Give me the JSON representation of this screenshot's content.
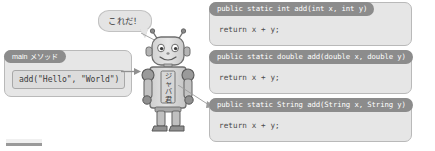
{
  "diagram": {
    "speech_bubble": {
      "text": "これだ！",
      "icon": "speech-bubble-icon"
    },
    "main_method": {
      "header_label": "main メソッド",
      "call_statement": "add(\"Hello\", \"World\")"
    },
    "character": {
      "name": "java-kun-robot",
      "chest_label": "ジャバ君",
      "label_chars": [
        "ジ",
        "ャ",
        "バ",
        "君"
      ]
    },
    "code_blocks": [
      {
        "signature": "public static int add(int x, int y)",
        "body": "return x + y;"
      },
      {
        "signature": "public static double add(double x, double y)",
        "body": "return x + y;"
      },
      {
        "signature": "public static String add(String x, String y)",
        "body": "return x + y;"
      }
    ],
    "connectors": [
      {
        "name": "arrow-main-to-robot",
        "kind": "arrow"
      },
      {
        "name": "line-bubble-to-robot",
        "kind": "line"
      },
      {
        "name": "line-robot-to-code",
        "kind": "arrow"
      }
    ],
    "colors": {
      "panel_fill": "#e6e6e6",
      "panel_border": "#b9b9b9",
      "header_fill": "#8c8c8c",
      "header_text": "#ffffff",
      "code_text": "#4a4a4a",
      "robot_body": "#d8d8d8",
      "robot_outline": "#6f6f6f",
      "robot_dark": "#5a5a5a",
      "background": "#ffffff"
    }
  }
}
